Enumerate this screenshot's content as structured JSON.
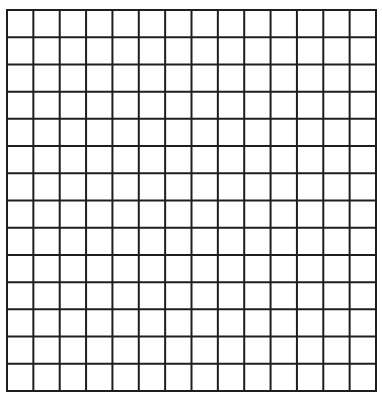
{
  "grid": {
    "rows": 14,
    "cols": 14,
    "left": 7,
    "top": 10,
    "right": 376,
    "bottom": 391,
    "line_width": 2,
    "line_color": "#1e1e1e",
    "background": "#ffffff"
  }
}
